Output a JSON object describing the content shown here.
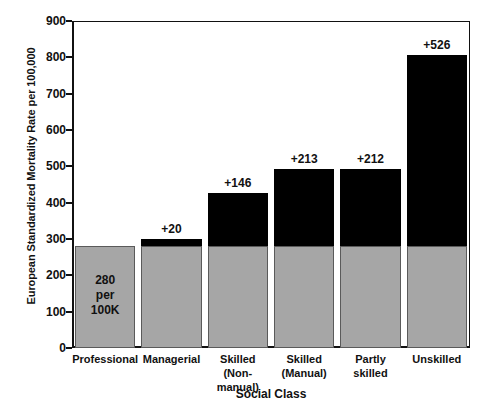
{
  "chart_data": {
    "type": "bar",
    "title": "",
    "subtitle": "",
    "xlabel": "Social Class",
    "ylabel": "European Standardized Mortality Rate per 100,000",
    "categories": [
      "Professional",
      "Managerial",
      "Skilled\n(Non-manual)",
      "Skilled\n(Manual)",
      "Partly skilled",
      "Unskilled"
    ],
    "ylim": [
      0,
      900
    ],
    "yticks": [
      0,
      100,
      200,
      300,
      400,
      500,
      600,
      700,
      800,
      900
    ],
    "ytick_labels": [
      "0",
      "100",
      "200",
      "300",
      "400",
      "500",
      "600",
      "700",
      "800",
      "900"
    ],
    "grid": false,
    "legend_position": "none",
    "stacked": true,
    "series": [
      {
        "name": "Baseline rate",
        "color": "#a6a6a6",
        "values": [
          280,
          280,
          280,
          280,
          280,
          280
        ]
      },
      {
        "name": "Excess over baseline",
        "color": "#000000",
        "values": [
          0,
          20,
          146,
          213,
          212,
          526
        ]
      }
    ],
    "totals": [
      280,
      300,
      426,
      493,
      492,
      806
    ],
    "increment_labels": [
      "",
      "+20",
      "+146",
      "+213",
      "+212",
      "+526"
    ],
    "baseline_annotation": "280\nper\n100K"
  },
  "colors": {
    "baseline_fill": "#a6a6a6",
    "baseline_edge": "#5a5a5a",
    "increment_fill": "#000000",
    "axis": "#111111",
    "background": "#ffffff"
  }
}
